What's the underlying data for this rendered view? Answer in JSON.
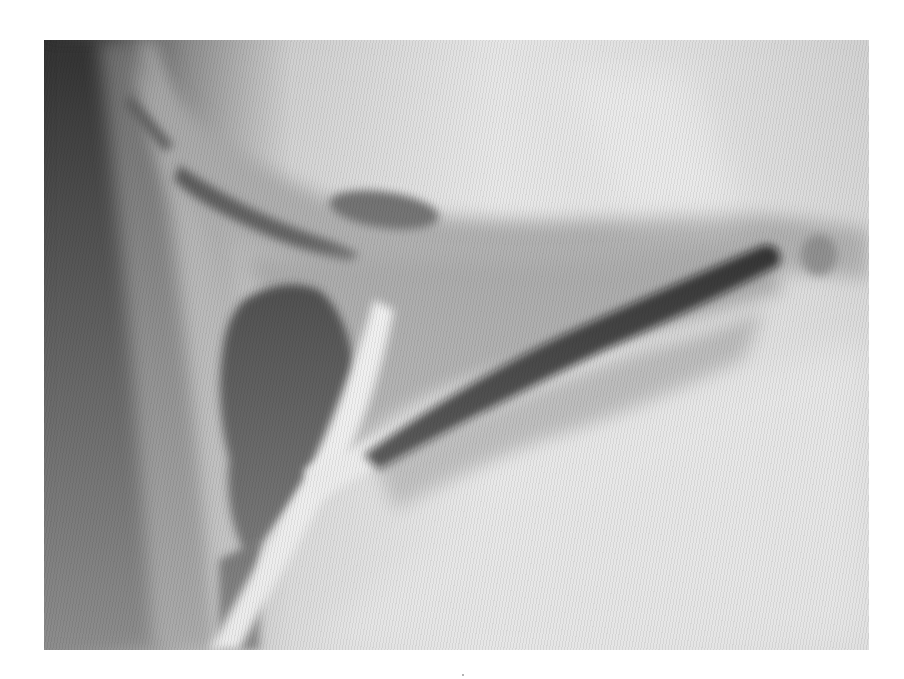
{
  "image": {
    "kind": "grayscale scanned photograph",
    "subject": "radiograph-like view of a branching tubular structure with a dark rounded lobe and a dark elongated channel",
    "frame": {
      "x": 44,
      "y": 40,
      "width": 825,
      "height": 610
    },
    "palette": {
      "page_background": "#ffffff",
      "light_field": "#e2e2e2",
      "mid_gray": "#9c9c9c",
      "dark_band": "#3a3a3a",
      "darkest": "#151515",
      "highlight": "#f4f4f4"
    }
  }
}
